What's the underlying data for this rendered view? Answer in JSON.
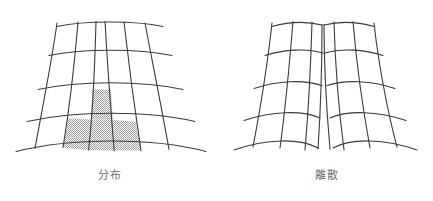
{
  "page": {
    "background_color": "#ffffff",
    "width": 433,
    "height": 201,
    "kind": "two-panel line-drawing figure"
  },
  "style": {
    "line_color": "#3a3a3a",
    "line_width": 1.1,
    "shade_fill_color": "#c9c9c9",
    "shade_pattern": "fine-checkerboard-stipple",
    "caption_color": "#6e6e6e",
    "caption_font_size": "11px"
  },
  "panels": [
    {
      "id": "distribution",
      "caption": "分布",
      "caption_meaning": "distribution",
      "description": "continuous curvilinear fan grid, narrow at top widening at bottom, with shaded cells",
      "rows": 4,
      "columns": 5,
      "horizontal_lines": 5,
      "vertical_lines": 6,
      "shaded_cells": [
        {
          "row": 3,
          "column": 3
        },
        {
          "row": 4,
          "column": 2
        },
        {
          "row": 4,
          "column": 3
        },
        {
          "row": 4,
          "column": 4
        }
      ]
    },
    {
      "id": "discrete",
      "caption": "離散",
      "caption_meaning": "discrete",
      "description": "same fan grid split down the middle into two halves separated by a wedge gap widening toward the bottom",
      "rows": 4,
      "columns": 4,
      "horizontal_lines": 5,
      "vertical_lines_per_half": 3,
      "split": true,
      "shaded_cells": []
    }
  ]
}
